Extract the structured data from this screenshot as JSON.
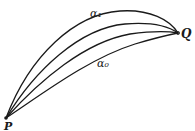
{
  "diagram": {
    "points": {
      "P": {
        "label": "P"
      },
      "Q": {
        "label": "Q"
      }
    },
    "curves": [
      {
        "id": "alpha_1",
        "label": "α₁"
      },
      {
        "id": "intermediate_1",
        "label": ""
      },
      {
        "id": "intermediate_2",
        "label": ""
      },
      {
        "id": "alpha_0",
        "label": "α₀"
      }
    ],
    "colors": {
      "stroke": "#1a1a1a",
      "background": "#ffffff"
    }
  }
}
